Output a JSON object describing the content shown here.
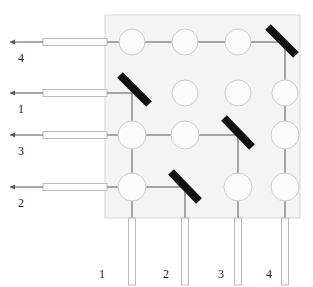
{
  "figure": {
    "type": "diagram",
    "background_color": "#ffffff",
    "substrate": {
      "name": "substrate-chip",
      "x": 105,
      "y": 15,
      "width": 195,
      "height": 203,
      "fill": "#f4f4f4",
      "stroke": "#d8d8d8"
    },
    "grid": {
      "columns": 4,
      "rows": 4,
      "col_x": [
        132,
        185,
        238,
        285
      ],
      "row_y": [
        42,
        93,
        135,
        187
      ],
      "circle_radius": 13,
      "circle_fill": "#fbfbfb",
      "circle_stroke": "#cccccc"
    },
    "circles": [
      {
        "row": 1,
        "col": 1,
        "cx": 132,
        "cy": 42,
        "r": 13
      },
      {
        "row": 1,
        "col": 2,
        "cx": 185,
        "cy": 42,
        "r": 13
      },
      {
        "row": 1,
        "col": 3,
        "cx": 238,
        "cy": 42,
        "r": 13
      },
      {
        "row": 2,
        "col": 2,
        "cx": 185,
        "cy": 93,
        "r": 13
      },
      {
        "row": 2,
        "col": 3,
        "cx": 238,
        "cy": 93,
        "r": 13
      },
      {
        "row": 2,
        "col": 4,
        "cx": 285,
        "cy": 93,
        "r": 13
      },
      {
        "row": 3,
        "col": 1,
        "cx": 132,
        "cy": 135,
        "r": 14
      },
      {
        "row": 3,
        "col": 2,
        "cx": 185,
        "cy": 135,
        "r": 14
      },
      {
        "row": 3,
        "col": 4,
        "cx": 285,
        "cy": 135,
        "r": 14
      },
      {
        "row": 4,
        "col": 1,
        "cx": 132,
        "cy": 187,
        "r": 14
      },
      {
        "row": 4,
        "col": 3,
        "cx": 238,
        "cy": 187,
        "r": 14
      },
      {
        "row": 4,
        "col": 4,
        "cx": 285,
        "cy": 187,
        "r": 14
      }
    ],
    "mirrors": [
      {
        "name": "mirror-r1-c4",
        "row": 1,
        "col": 4,
        "x1": 268,
        "y1": 27,
        "x2": 296,
        "y2": 55,
        "color": "#111111",
        "thickness": 8
      },
      {
        "name": "mirror-r2-c1",
        "row": 2,
        "col": 1,
        "x1": 120,
        "y1": 75,
        "x2": 149,
        "y2": 104,
        "color": "#111111",
        "thickness": 8
      },
      {
        "name": "mirror-r3-c3",
        "row": 3,
        "col": 3,
        "x1": 224,
        "y1": 118,
        "x2": 252,
        "y2": 147,
        "color": "#111111",
        "thickness": 8
      },
      {
        "name": "mirror-r4-c2",
        "row": 4,
        "col": 2,
        "x1": 171,
        "y1": 172,
        "x2": 199,
        "y2": 201,
        "color": "#111111",
        "thickness": 8
      }
    ],
    "input_ports": [
      {
        "label": "4",
        "row": 1,
        "y": 42,
        "arrow_x": 10,
        "guide_x1": 43,
        "guide_x2": 107,
        "label_x": 18,
        "label_y": 52
      },
      {
        "label": "1",
        "row": 2,
        "y": 93,
        "arrow_x": 10,
        "guide_x1": 43,
        "guide_x2": 107,
        "label_x": 18,
        "label_y": 103
      },
      {
        "label": "3",
        "row": 3,
        "y": 135,
        "arrow_x": 10,
        "guide_x1": 43,
        "guide_x2": 107,
        "label_x": 18,
        "label_y": 145
      },
      {
        "label": "2",
        "row": 4,
        "y": 187,
        "arrow_x": 10,
        "guide_x1": 43,
        "guide_x2": 107,
        "label_x": 18,
        "label_y": 197
      }
    ],
    "output_ports": [
      {
        "label": "1",
        "col": 1,
        "x": 132,
        "y1": 218,
        "y2": 285,
        "label_x": 99,
        "label_y": 268
      },
      {
        "label": "2",
        "col": 2,
        "x": 185,
        "y1": 218,
        "y2": 285,
        "label_x": 163,
        "label_y": 268
      },
      {
        "label": "3",
        "col": 3,
        "x": 238,
        "y1": 218,
        "y2": 285,
        "label_x": 218,
        "label_y": 268
      },
      {
        "label": "4",
        "col": 4,
        "x": 285,
        "y1": 218,
        "y2": 285,
        "label_x": 266,
        "label_y": 268
      }
    ],
    "routes": [
      {
        "name": "route-in4-out4",
        "input": "4",
        "output": "4",
        "path": "M 43 42 L 285 42 L 285 218"
      },
      {
        "name": "route-in1-out1",
        "input": "1",
        "output": "1",
        "path": "M 43 93 L 132 93 L 132 218"
      },
      {
        "name": "route-in3-out3",
        "input": "3",
        "output": "3",
        "path": "M 43 135 L 238 135 L 238 218"
      },
      {
        "name": "route-in2-out2",
        "input": "2",
        "output": "2",
        "path": "M 43 187 L 185 187 L 185 218"
      }
    ],
    "waveguide": {
      "fill": "#fdfdfd",
      "stroke": "#b4b4b4",
      "thickness": 7,
      "line_color": "#555555"
    }
  }
}
